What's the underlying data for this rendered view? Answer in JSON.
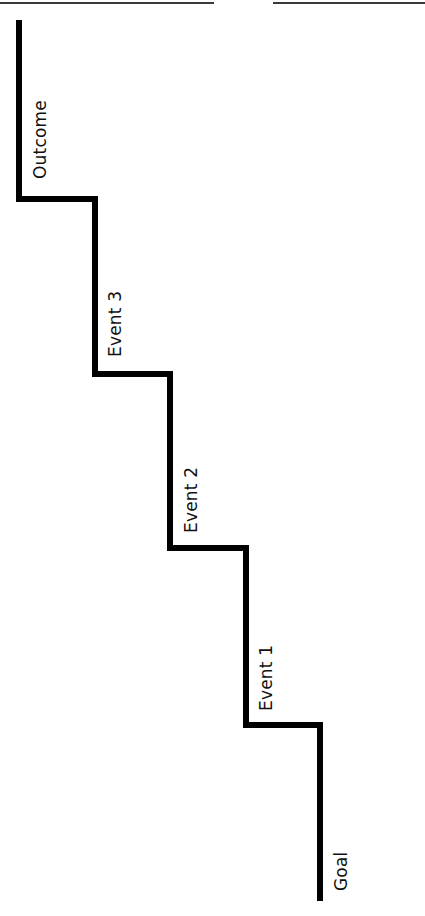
{
  "diagram": {
    "type": "staircase",
    "orientation": "rotated-90",
    "stroke_color": "#000000",
    "stroke_width": 6,
    "steps": [
      {
        "label": "Goal",
        "order": 0
      },
      {
        "label": "Event 1",
        "order": 1
      },
      {
        "label": "Event 2",
        "order": 2
      },
      {
        "label": "Event 3",
        "order": 3
      },
      {
        "label": "Outcome",
        "order": 4
      }
    ],
    "path_points": [
      [
        19,
        20
      ],
      [
        19,
        199
      ],
      [
        95,
        199
      ],
      [
        95,
        374
      ],
      [
        170,
        374
      ],
      [
        170,
        548
      ],
      [
        246,
        548
      ],
      [
        246,
        725
      ],
      [
        320,
        725
      ],
      [
        320,
        901
      ]
    ]
  },
  "labels": {
    "goal": "Goal",
    "event1": "Event 1",
    "event2": "Event 2",
    "event3": "Event 3",
    "outcome": "Outcome"
  }
}
